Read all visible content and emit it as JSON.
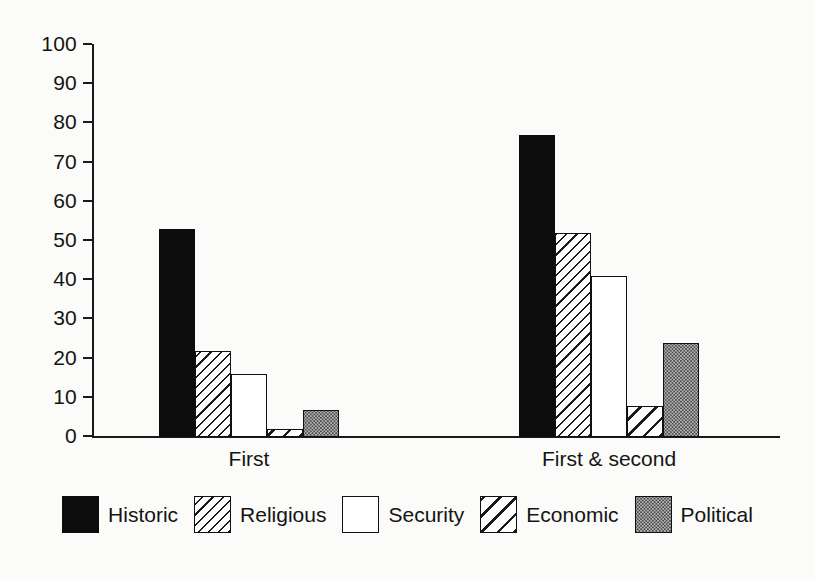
{
  "chart_data": {
    "type": "bar",
    "title": "",
    "xlabel": "",
    "ylabel": "",
    "ylim": [
      0,
      100
    ],
    "ytick_step": 10,
    "grid": false,
    "legend_position": "bottom",
    "categories": [
      "First",
      "First & second"
    ],
    "series": [
      {
        "name": "Historic",
        "pattern": "solid-black",
        "values": [
          53,
          77
        ]
      },
      {
        "name": "Religious",
        "pattern": "dense-hatch",
        "values": [
          22,
          52
        ]
      },
      {
        "name": "Security",
        "pattern": "empty-white",
        "values": [
          16,
          41
        ]
      },
      {
        "name": "Economic",
        "pattern": "wide-hatch",
        "values": [
          2,
          8
        ]
      },
      {
        "name": "Political",
        "pattern": "dotted-gray",
        "values": [
          7,
          24
        ]
      }
    ],
    "ytick_labels": [
      "100",
      "90",
      "80",
      "70",
      "60",
      "50",
      "40",
      "30",
      "20",
      "10",
      "0"
    ]
  },
  "axis": {
    "y_ticks": [
      {
        "label": "100",
        "value": 100
      },
      {
        "label": "90",
        "value": 90
      },
      {
        "label": "80",
        "value": 80
      },
      {
        "label": "70",
        "value": 70
      },
      {
        "label": "60",
        "value": 60
      },
      {
        "label": "50",
        "value": 50
      },
      {
        "label": "40",
        "value": 40
      },
      {
        "label": "30",
        "value": 30
      },
      {
        "label": "20",
        "value": 20
      },
      {
        "label": "10",
        "value": 10
      },
      {
        "label": "0",
        "value": 0
      }
    ]
  },
  "groups": [
    {
      "label": "First",
      "center_x": 249
    },
    {
      "label": "First & second",
      "center_x": 609
    }
  ],
  "legend": {
    "items": [
      {
        "label": "Historic",
        "pattern": "solid-black"
      },
      {
        "label": "Religious",
        "pattern": "dense-hatch"
      },
      {
        "label": "Security",
        "pattern": "empty-white"
      },
      {
        "label": "Economic",
        "pattern": "wide-hatch"
      },
      {
        "label": "Political",
        "pattern": "dotted-gray"
      }
    ]
  },
  "colors": {
    "axis": "#1a1a1a",
    "text": "#141414",
    "solid": "#0c0c0c",
    "hatch_line": "#1a1a1a",
    "dotted_fill": "#b8b8b8",
    "dotted_dot": "#4a4a4a",
    "background": "#fbfbf9"
  }
}
